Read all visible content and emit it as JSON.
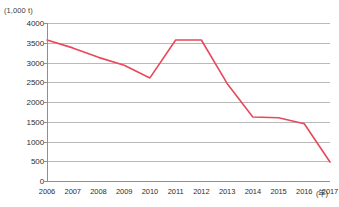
{
  "chart_data": {
    "type": "line",
    "title": "",
    "subtitle": "",
    "xlabel": "(年)",
    "ylabel": "(1,000 t)",
    "unit_label": "(1,000 t)",
    "x_unit_label": "(年)",
    "categories": [
      "2006",
      "2007",
      "2008",
      "2009",
      "2010",
      "2011",
      "2012",
      "2013",
      "2014",
      "2015",
      "2016",
      "2017"
    ],
    "values": [
      3570,
      3370,
      3130,
      2930,
      2610,
      3570,
      3570,
      2470,
      1620,
      1600,
      1450,
      480
    ],
    "series": [
      {
        "name": "",
        "color": "#e8485a",
        "values": [
          3570,
          3370,
          3130,
          2930,
          2610,
          3570,
          3570,
          2470,
          1620,
          1600,
          1450,
          480
        ]
      }
    ],
    "ylim": [
      0,
      4000
    ],
    "yticks": [
      0,
      500,
      1000,
      1500,
      2000,
      2500,
      3000,
      3500,
      4000
    ],
    "ytick_labels": [
      "0",
      "500",
      "1000",
      "1500",
      "2000",
      "2500",
      "3000",
      "3500",
      "4000"
    ],
    "xtick_labels": [
      "2006",
      "2007",
      "2008",
      "2009",
      "2010",
      "2011",
      "2012",
      "2013",
      "2014",
      "2015",
      "2016",
      "2017"
    ],
    "grid": true,
    "grid_axis": "y",
    "legend": false,
    "legend_position": "none",
    "markers": false,
    "line_color": "#e8485a",
    "grid_color": "#b9b9b9",
    "axis_color": "#8f8f8f",
    "text_color": "#2e2e2e"
  }
}
